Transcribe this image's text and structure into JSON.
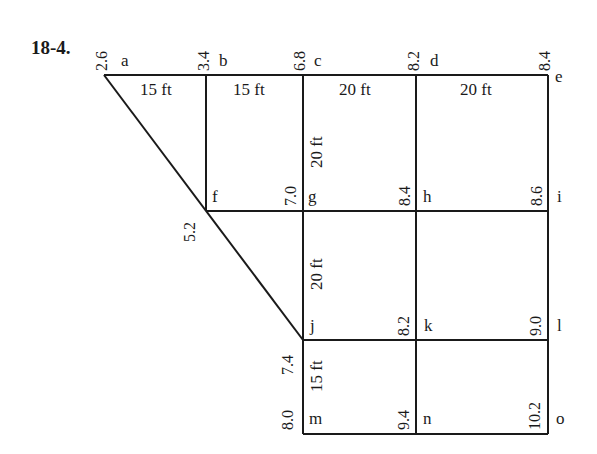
{
  "problem_number": "18-4.",
  "colors": {
    "line": "#1a1a1a",
    "background": "#ffffff"
  },
  "points": {
    "a": {
      "label": "a",
      "elevation": "2.6"
    },
    "b": {
      "label": "b",
      "elevation": "3.4"
    },
    "c": {
      "label": "c",
      "elevation": "6.8"
    },
    "d": {
      "label": "d",
      "elevation": "8.2"
    },
    "e": {
      "label": "e",
      "elevation": "8.4"
    },
    "f": {
      "label": "f",
      "elevation": "5.2"
    },
    "g": {
      "label": "g",
      "elevation": "7.0"
    },
    "h": {
      "label": "h",
      "elevation": "8.4"
    },
    "i": {
      "label": "i",
      "elevation": "8.6"
    },
    "j": {
      "label": "j",
      "elevation": "7.4"
    },
    "k": {
      "label": "k",
      "elevation": "8.2"
    },
    "l": {
      "label": "l",
      "elevation": "9.0"
    },
    "m": {
      "label": "m",
      "elevation": "8.0"
    },
    "n": {
      "label": "n",
      "elevation": "9.4"
    },
    "o": {
      "label": "o",
      "elevation": "10.2"
    }
  },
  "dimensions": {
    "ab": "15 ft",
    "bc": "15 ft",
    "cd": "20 ft",
    "de": "20 ft",
    "cg": "20 ft",
    "gj": "20 ft",
    "jm": "15 ft"
  }
}
